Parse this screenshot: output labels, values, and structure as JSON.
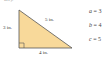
{
  "figure": {
    "top_fragment": "ure).",
    "fill_color": "#f8d99a",
    "stroke_color": "#555555",
    "labels": {
      "hypotenuse": "5 in.",
      "left_leg": "3 in.",
      "bottom_leg": "4 in."
    },
    "equations": [
      {
        "var": "a",
        "op": "=",
        "value": "3"
      },
      {
        "var": "b",
        "op": "=",
        "value": "4"
      },
      {
        "var": "c",
        "op": "=",
        "value": "5"
      }
    ]
  }
}
